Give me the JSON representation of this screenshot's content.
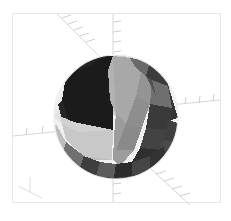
{
  "figure": {
    "title": "",
    "kind": "3d-surface-plot",
    "background_color": "#ffffff",
    "frame_color": "#e6e6e6",
    "axis_color": "#d8d8d8",
    "tick_color": "#cfcfcf",
    "frame": {
      "x": 12,
      "y": 13,
      "width": 209,
      "height": 190
    }
  },
  "chart_data": {
    "type": "scatter",
    "title": "",
    "xlabel": "",
    "ylabel": "",
    "zlabel": "",
    "grid": false,
    "legend": "none",
    "projection": "3d-perspective",
    "object": "faceted-sphere",
    "center": {
      "x": 116,
      "y": 117
    },
    "radius": 62,
    "facet_rows": 8,
    "facet_columns": 16,
    "shading": "flat-grayscale",
    "xlim": [
      -1,
      1
    ],
    "ylim": [
      -1,
      1
    ],
    "zlim": [
      -1,
      1
    ],
    "axis_tick_counts": {
      "x_left": 3,
      "x_right": 4,
      "y_up_left": 8,
      "y_down_right": 5,
      "z_vertical": 5
    },
    "palette": {
      "near_white": "#f2f2f2",
      "light": "#d9d9d9",
      "light_mid": "#c2c2c2",
      "mid": "#a8a8a8",
      "mid_dark": "#8c8c8c",
      "dark": "#6b6b6b",
      "darker": "#4a4a4a",
      "near_black": "#2b2b2b",
      "black": "#1e1e1e"
    },
    "regions": [
      {
        "name": "top-cap",
        "color": "#dcdcdc",
        "note": "light gray polar cap with spiral highlight"
      },
      {
        "name": "upper-left-wedge",
        "color": "#1f1f1f",
        "note": "large near-black wedge"
      },
      {
        "name": "front-left-wedge",
        "color": "#c9c9c9",
        "note": "light gray front wedge"
      },
      {
        "name": "front-right-wedge",
        "color": "#9e9e9e",
        "note": "mid gray wedge meeting at center vertex"
      },
      {
        "name": "right-band",
        "color": "#3a3a3a",
        "note": "dark facet band on right limb"
      },
      {
        "name": "lower-band",
        "color": "#4f4f4f",
        "note": "dark bottom band facets"
      },
      {
        "name": "left-limb",
        "color": "#efefef",
        "note": "bright silhouette edge at left"
      }
    ],
    "values": [
      0.98,
      0.86,
      0.74,
      0.63,
      0.52,
      0.41,
      0.29,
      0.18,
      0.07
    ]
  }
}
